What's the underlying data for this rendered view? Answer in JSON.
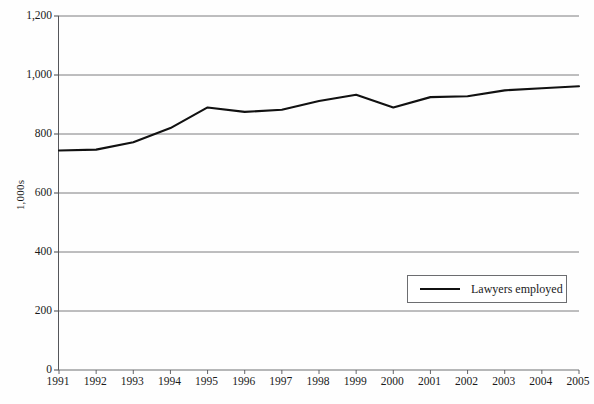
{
  "chart_data": {
    "type": "line",
    "title": "",
    "subtitle": "",
    "xlabel": "",
    "ylabel": "1,000s",
    "categories": [
      "1991",
      "1992",
      "1993",
      "1994",
      "1995",
      "1996",
      "1997",
      "1998",
      "1999",
      "2000",
      "2001",
      "2002",
      "2003",
      "2004",
      "2005"
    ],
    "series": [
      {
        "name": "Lawyers employed",
        "color": "#111111",
        "values": [
          744,
          747,
          772,
          820,
          890,
          875,
          882,
          912,
          933,
          890,
          925,
          928,
          948,
          955,
          962
        ]
      }
    ],
    "ylim": [
      0,
      1200
    ],
    "yticks": [
      0,
      200,
      400,
      600,
      800,
      1000,
      1200
    ],
    "ytick_labels": [
      "0",
      "200",
      "400",
      "600",
      "800",
      "1,000",
      "1,200"
    ],
    "grid": "horizontal",
    "legend_position": "inside-lower-right",
    "legend_entries": [
      "Lawyers employed"
    ]
  },
  "axes": {
    "y_label": "1,000s",
    "y_tick_labels": [
      "1,200",
      "1,000",
      "800",
      "600",
      "400",
      "200",
      "0"
    ],
    "x_tick_labels": [
      "1991",
      "1992",
      "1993",
      "1994",
      "1995",
      "1996",
      "1997",
      "1998",
      "1999",
      "2000",
      "2001",
      "2002",
      "2003",
      "2004",
      "2005"
    ]
  },
  "legend": {
    "label": "Lawyers employed"
  },
  "colors": {
    "series_line": "#111111",
    "gridline": "#6f7073",
    "axis": "#55565a",
    "background": "#fefefe",
    "text": "#1a1a1a"
  }
}
